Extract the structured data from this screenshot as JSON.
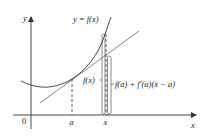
{
  "figure": {
    "colors": {
      "axis": "#333333",
      "curve": "#333333",
      "tangent": "#666666",
      "dashed": "#333333",
      "bracket": "#444444",
      "text": "#1a1a1a"
    },
    "axes": {
      "x_label": "x",
      "y_label": "y",
      "origin_label": "0",
      "ticks": [
        {
          "name": "a",
          "label": "a"
        },
        {
          "name": "x",
          "label": "x"
        }
      ]
    },
    "curve": {
      "label": "y = f(x)"
    },
    "annotations": {
      "fx_label": "f(x)",
      "tangent_value_label": "f(a) + f′(a)(x − a)"
    }
  }
}
